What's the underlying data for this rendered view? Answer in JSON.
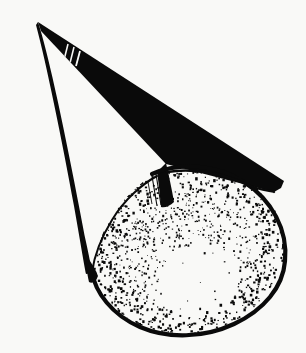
{
  "document": {
    "title": "Cone with stippled spherical cap",
    "medium": "pen-and-ink line drawing",
    "background_color": "#f9f9f7",
    "ink_color": "#0a0a0a",
    "canvas": {
      "width": 306,
      "height": 353
    }
  },
  "figure": {
    "name": "cone-figure",
    "apex": {
      "x": 38,
      "y": 22
    },
    "parts": [
      {
        "id": "cone-apex",
        "label": "apex"
      },
      {
        "id": "cone-left-edge",
        "label": "left silhouette edge"
      },
      {
        "id": "cone-upper-band",
        "label": "upper shaded band"
      },
      {
        "id": "cone-inner-fold",
        "label": "inner fold cusp"
      },
      {
        "id": "sphere-mass",
        "label": "stippled ellipsoidal mass"
      },
      {
        "id": "sphere-outline",
        "label": "ellipse outline"
      }
    ],
    "geometry": {
      "cone_left_edge": "M 38 22 L 92 272",
      "cone_band_outer": "M 38 22 L 283 182",
      "cone_band_inner": "M 42 30 L 166 164",
      "cone_right_lower": "M 166 164 L 274 192",
      "ellipse": {
        "center_x": 187,
        "center_y": 252,
        "radius_x": 98,
        "radius_y": 82,
        "rotation_deg": -14
      },
      "cusp": {
        "x": 166,
        "y": 163
      }
    },
    "shading": {
      "style": "stipple",
      "dot_count": 1500,
      "dense_regions": [
        "upper-left rim",
        "upper-right rim",
        "lower-left rim"
      ],
      "sparse_regions": [
        "center-lower highlight"
      ],
      "hatch_marks_near_apex": 3
    }
  }
}
